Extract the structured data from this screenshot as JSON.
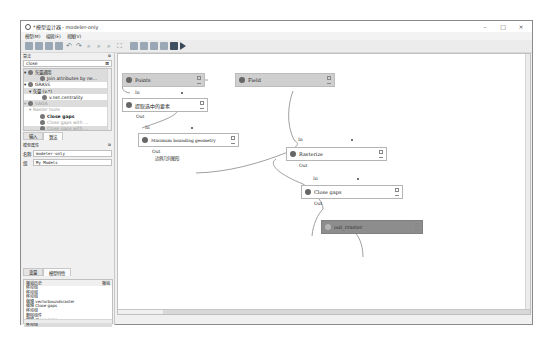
{
  "window": {
    "title": "*模型设计器 - modeler-only",
    "controls": {
      "minimize": "–",
      "maximize": "□",
      "close": "×"
    }
  },
  "menubar": {
    "items": [
      "模型(M)",
      "编辑(E)",
      "视图(V)"
    ]
  },
  "toolbar": {
    "buttons": [
      "open-model",
      "save-model",
      "save-as",
      "export",
      "undo",
      "redo",
      "zoom-in",
      "zoom-out",
      "zoom-actual",
      "zoom-full",
      "export-image",
      "export-pdf",
      "export-svg",
      "export-script",
      "properties",
      "run-model"
    ]
  },
  "algorithms_panel": {
    "title": "算法",
    "search_value": "close",
    "tree": [
      {
        "label": "矢量通用",
        "type": "group",
        "level": 0
      },
      {
        "label": "Join attributes by ne...",
        "type": "item",
        "level": 2
      },
      {
        "label": "GRASS",
        "type": "group",
        "level": 0
      },
      {
        "label": "矢量 (v.*)",
        "type": "group",
        "level": 1
      },
      {
        "label": "v.net.centrality",
        "type": "item",
        "level": 2
      },
      {
        "label": "SAGA",
        "type": "group",
        "level": 0,
        "dim": true
      },
      {
        "label": "Raster tools",
        "type": "group",
        "level": 1,
        "dim": true
      },
      {
        "label": "Close gaps",
        "type": "item",
        "level": 2,
        "bold": true
      },
      {
        "label": "Close gaps with ...",
        "type": "item",
        "level": 2,
        "dim": true
      },
      {
        "label": "Close gaps with ...",
        "type": "item",
        "level": 2,
        "dim": true
      }
    ],
    "tabs": [
      "输入",
      "算法"
    ],
    "active_tab": "算法"
  },
  "model_properties": {
    "title": "模型属性",
    "name_label": "名称",
    "name_value": "modeler-only",
    "group_label": "组",
    "group_value": "My Models"
  },
  "bottom_tabs": [
    "变量",
    "模型特性"
  ],
  "history": {
    "title": "撤销历史",
    "undo_label": "撤销",
    "items": [
      "移动组",
      "移动组",
      "移动组",
      "编辑 vectorboundsraster",
      "编辑 Close gaps",
      "移动组",
      "删除组件",
      "编辑 Close gaps",
      "移动组"
    ]
  },
  "canvas": {
    "nodes": [
      {
        "id": "points",
        "label": "Points",
        "kind": "input"
      },
      {
        "id": "field",
        "label": "Field",
        "kind": "input"
      },
      {
        "id": "extract",
        "label": "提取选中的要素",
        "kind": "algorithm",
        "in": "In",
        "out": "Out"
      },
      {
        "id": "mbg",
        "label": "Minimum bounding geometry",
        "kind": "algorithm",
        "in": "In",
        "out": "Out",
        "out2": "边界几何图形"
      },
      {
        "id": "rasterize",
        "label": "Rasterize",
        "kind": "algorithm",
        "in": "In",
        "out": "Out"
      },
      {
        "id": "closegaps",
        "label": "Close gaps",
        "kind": "algorithm",
        "in": "In",
        "out": "Out"
      },
      {
        "id": "out_raster",
        "label": "out_rraster",
        "kind": "output"
      }
    ]
  },
  "colors": {
    "input_node": "#cfcfcf",
    "output_node": "#8d8d8d",
    "algorithm_node": "#ffffff",
    "link": "#777777"
  }
}
